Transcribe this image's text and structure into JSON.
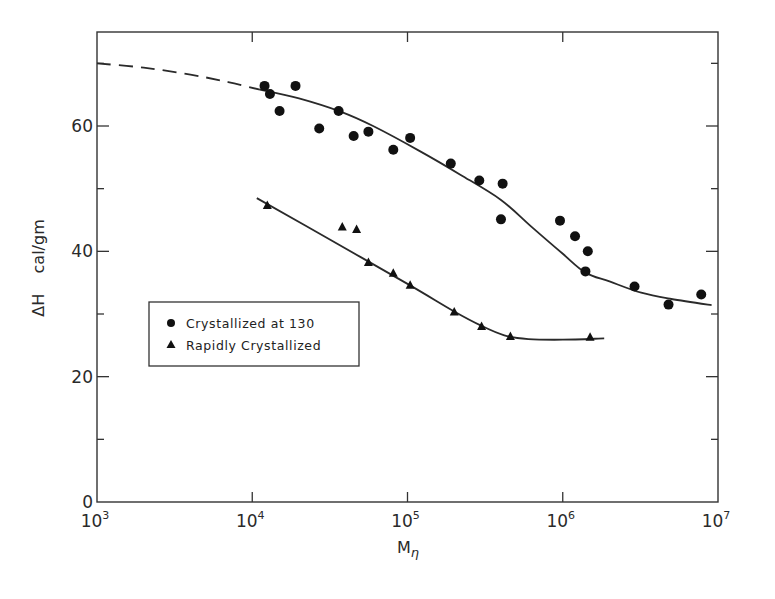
{
  "chart_data": {
    "type": "scatter",
    "title": "",
    "xlabel": "Mη",
    "ylabel": "ΔH    cal/gm",
    "xscale": "log",
    "xlim": [
      1000,
      10000000
    ],
    "ylim": [
      0,
      75
    ],
    "x_ticks": [
      {
        "value": 1000,
        "base": "10",
        "exp": "3"
      },
      {
        "value": 10000,
        "base": "10",
        "exp": "4"
      },
      {
        "value": 100000,
        "base": "10",
        "exp": "5"
      },
      {
        "value": 1000000,
        "base": "10",
        "exp": "6"
      },
      {
        "value": 10000000,
        "base": "10",
        "exp": "7"
      }
    ],
    "y_ticks_major": [
      0,
      20,
      40,
      60
    ],
    "y_tick_labels": [
      "0",
      "20",
      "40",
      "60"
    ],
    "y_ticks_minor": [
      10,
      30,
      50,
      70
    ],
    "grid": false,
    "legend_position": "center-left",
    "series": [
      {
        "name": "Crystallized at 130",
        "marker": "circle",
        "points": [
          [
            12000,
            66.4
          ],
          [
            13000,
            65.1
          ],
          [
            15000,
            62.4
          ],
          [
            19000,
            66.4
          ],
          [
            27000,
            59.6
          ],
          [
            36000,
            62.4
          ],
          [
            45000,
            58.4
          ],
          [
            56000,
            59.1
          ],
          [
            81000,
            56.2
          ],
          [
            104000,
            58.1
          ],
          [
            190000,
            54.0
          ],
          [
            290000,
            51.3
          ],
          [
            410000,
            50.8
          ],
          [
            400000,
            45.1
          ],
          [
            960000,
            44.9
          ],
          [
            1200000,
            42.4
          ],
          [
            1450000,
            40.0
          ],
          [
            1400000,
            36.8
          ],
          [
            2900000,
            34.4
          ],
          [
            4800000,
            31.5
          ],
          [
            7800000,
            33.1
          ]
        ],
        "fit_curve": [
          [
            11200,
            65.8
          ],
          [
            20000,
            64.4
          ],
          [
            37000,
            62.3
          ],
          [
            60000,
            60.0
          ],
          [
            120000,
            56.0
          ],
          [
            220000,
            52.2
          ],
          [
            400000,
            48.2
          ],
          [
            630000,
            43.9
          ],
          [
            1000000,
            39.6
          ],
          [
            1400000,
            36.6
          ],
          [
            2000000,
            35.2
          ],
          [
            3200000,
            33.4
          ],
          [
            5000000,
            32.4
          ],
          [
            9100000,
            31.4
          ]
        ],
        "extrapolation_dashed": [
          [
            1000,
            70.0
          ],
          [
            2000,
            69.3
          ],
          [
            4000,
            68.2
          ],
          [
            7000,
            67.0
          ],
          [
            11200,
            65.8
          ]
        ]
      },
      {
        "name": "Rapidly Crystallized",
        "marker": "triangle",
        "points": [
          [
            12500,
            47.3
          ],
          [
            38000,
            43.9
          ],
          [
            47000,
            43.5
          ],
          [
            56000,
            38.2
          ],
          [
            81000,
            36.5
          ],
          [
            104000,
            34.6
          ],
          [
            200000,
            30.3
          ],
          [
            300000,
            28.0
          ],
          [
            460000,
            26.4
          ],
          [
            1500000,
            26.3
          ]
        ],
        "fit_curve": [
          [
            10700,
            48.5
          ],
          [
            30000,
            42.2
          ],
          [
            100000,
            34.8
          ],
          [
            200000,
            30.4
          ],
          [
            300000,
            28.1
          ],
          [
            420000,
            26.6
          ],
          [
            600000,
            26.0
          ],
          [
            1000000,
            25.9
          ],
          [
            1850000,
            26.1
          ]
        ]
      }
    ]
  }
}
